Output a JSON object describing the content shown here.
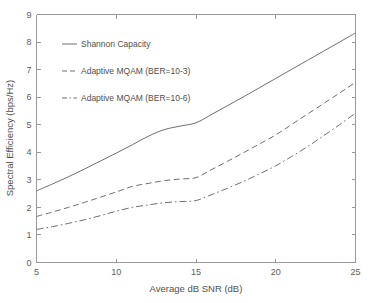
{
  "chart_data": {
    "type": "line",
    "title": "",
    "xlabel": "Average dB SNR (dB)",
    "ylabel": "Spectral Efficiency (bps/Hz)",
    "xlim": [
      5,
      25
    ],
    "ylim": [
      0,
      9
    ],
    "xticks": [
      "5",
      "10",
      "15",
      "20",
      "25"
    ],
    "xtick_values": [
      5,
      10,
      15,
      20,
      25
    ],
    "yticks": [
      "0",
      "1",
      "2",
      "3",
      "4",
      "5",
      "6",
      "7",
      "8",
      "9"
    ],
    "ytick_values": [
      0,
      1,
      2,
      3,
      4,
      5,
      6,
      7,
      8,
      9
    ],
    "grid": false,
    "legend_position": "upper-left-inside",
    "x": [
      5,
      6,
      7,
      8,
      9,
      10,
      11,
      12,
      13,
      14,
      15,
      16,
      17,
      18,
      19,
      20,
      21,
      22,
      23,
      24,
      25
    ],
    "series": [
      {
        "name": "Shannon Capacity",
        "style": "solid",
        "color": "#6e6e6e",
        "values": [
          2.6,
          2.85,
          3.11,
          3.39,
          3.68,
          3.97,
          4.27,
          4.58,
          4.82,
          4.95,
          5.07,
          5.38,
          5.7,
          6.02,
          6.35,
          6.68,
          7.01,
          7.34,
          7.67,
          8.0,
          8.33
        ]
      },
      {
        "name": "Adaptive MQAM (BER=10-3)",
        "style": "dashed",
        "color": "#6e6e6e",
        "values": [
          1.67,
          1.83,
          2.0,
          2.18,
          2.37,
          2.56,
          2.76,
          2.87,
          2.97,
          3.03,
          3.08,
          3.38,
          3.68,
          3.99,
          4.31,
          4.63,
          5.01,
          5.39,
          5.77,
          6.15,
          6.54
        ]
      },
      {
        "name": "Adaptive MQAM (BER=10-6)",
        "style": "dashdot",
        "color": "#6e6e6e",
        "values": [
          1.2,
          1.3,
          1.42,
          1.55,
          1.7,
          1.86,
          2.0,
          2.09,
          2.17,
          2.21,
          2.25,
          2.47,
          2.7,
          2.95,
          3.22,
          3.51,
          3.85,
          4.21,
          4.6,
          5.0,
          5.42
        ]
      }
    ]
  },
  "legend": {
    "items": [
      {
        "label": "Shannon Capacity",
        "style": "solid"
      },
      {
        "label": "Adaptive MQAM (BER=10-3)",
        "style": "dashed"
      },
      {
        "label": "Adaptive MQAM (BER=10-6)",
        "style": "dashdot"
      }
    ]
  }
}
